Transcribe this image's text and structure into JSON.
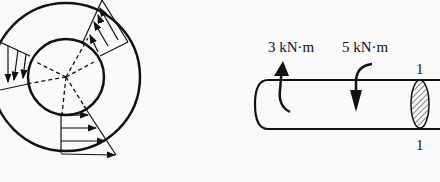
{
  "figure": {
    "left_panel": {
      "description": "Annular cross-section with linear shear stress distribution",
      "icon": "annulus-shear-stress-diagram"
    },
    "right_panel": {
      "description": "Shaft with applied torques and section 1-1",
      "torque_labels": [
        "3 kN·m",
        "5 kN·m"
      ],
      "section_label_top": "1",
      "section_label_bottom": "1"
    }
  }
}
